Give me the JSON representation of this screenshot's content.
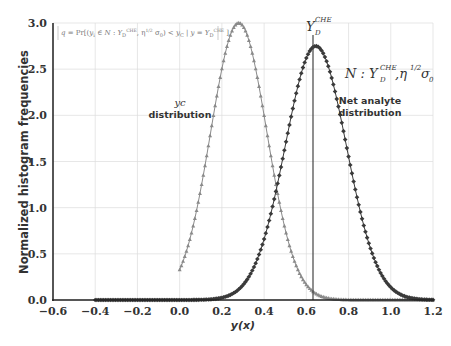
{
  "chart_data": {
    "type": "line",
    "title": "",
    "xlabel": "y(x)",
    "ylabel": "Normalized histogram frequencies",
    "xlim": [
      -0.6,
      1.2
    ],
    "ylim": [
      0.0,
      3.0
    ],
    "grid": true,
    "xticks": [
      "-0.6",
      "-0.4",
      "-0.2",
      "0.0",
      "0.2",
      "0.4",
      "0.6",
      "0.8",
      "1.0",
      "1.2"
    ],
    "yticks": [
      "0.0",
      "0.5",
      "1.0",
      "1.5",
      "2.0",
      "2.5",
      "3.0"
    ],
    "series": [
      {
        "name": "yc distribution",
        "marker": "triangle",
        "color": "#8a8a8a",
        "shape": "truncated gaussian",
        "mean": 0.28,
        "sd": 0.133,
        "peak": 3.0,
        "x_start": 0.0,
        "x_end": 1.2
      },
      {
        "name": "Net analyte distribution",
        "marker": "diamond",
        "color": "#3a3a3a",
        "shape": "gaussian",
        "mean": 0.645,
        "sd": 0.145,
        "peak": 2.75,
        "x_start": -0.4,
        "x_end": 1.2
      }
    ],
    "vertical_line": {
      "x": 0.645,
      "label": "Y_D^CHE"
    },
    "annotations": [
      {
        "text": "q = Pr[(y_i ∈ N : Y_D^CHE, η^1/2 σ_0) < y_C | y = Y_D^CHE]",
        "position": "top-left"
      },
      {
        "text": "N : Y_D^CHE, η^1/2 σ_0",
        "position": "right"
      },
      {
        "text": "yc distribution",
        "position": "left-middle"
      },
      {
        "text": "Net analyte distribution",
        "position": "right-middle"
      }
    ]
  },
  "labels": {
    "xlabel": "y(x)",
    "ylabel": "Normalized histogram frequencies",
    "formula": "q = Pr[(y",
    "formula_rest": "∈ N : Y",
    "formula_tail": ", η",
    "formula_end": "σ",
    "formula_cond": ") < y",
    "formula_given": " | y = Y",
    "yc_sym": "yc",
    "yc_dist": "distribution",
    "net_1": "Net analyte",
    "net_2": "distribution",
    "yd": "Y",
    "yd_sub": "D",
    "yd_sup": "CHE",
    "norm_n": "N : Y",
    "norm_eta": ",η",
    "norm_half": "1/2",
    "norm_sigma": "σ",
    "norm_zero": "0"
  },
  "xticks": [
    "-0.6",
    "-0.4",
    "-0.2",
    "0.0",
    "0.2",
    "0.4",
    "0.6",
    "0.8",
    "1.0",
    "1.2"
  ],
  "yticks": [
    "0.0",
    "0.5",
    "1.0",
    "1.5",
    "2.0",
    "2.5",
    "3.0"
  ]
}
